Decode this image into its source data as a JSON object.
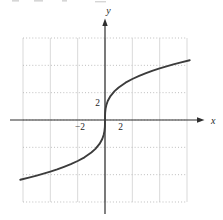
{
  "figure": {
    "background": "#ffffff",
    "axis_color": "#2e2e2e",
    "curve_color": "#3c3c3c",
    "grid_vertical_color": "#cfcfcf",
    "grid_dotted_color": "#b8b8b8",
    "label_color": "#1f1f1f"
  },
  "chart_data": {
    "type": "line",
    "title": "",
    "xlabel": "x",
    "ylabel": "y",
    "xlim": [
      -6,
      6
    ],
    "ylim": [
      -6,
      6
    ],
    "grid": "on",
    "grid_cells": 6,
    "units_per_cell": 2,
    "x_ticks": [
      {
        "value": -2,
        "label": "−2"
      },
      {
        "value": 2,
        "label": "2"
      }
    ],
    "y_ticks": [
      {
        "value": 2,
        "label": "2"
      }
    ],
    "series": [
      {
        "name": "cube-root-style odd curve through origin",
        "points": [
          [
            -6.2,
            -4.37
          ],
          [
            -5.5,
            -4.2
          ],
          [
            -5,
            -4.07
          ],
          [
            -4.5,
            -3.93
          ],
          [
            -4,
            -3.78
          ],
          [
            -3.5,
            -3.62
          ],
          [
            -3,
            -3.43
          ],
          [
            -2.5,
            -3.23
          ],
          [
            -2,
            -3.0
          ],
          [
            -1.5,
            -2.73
          ],
          [
            -1,
            -2.38
          ],
          [
            -0.7,
            -2.11
          ],
          [
            -0.4,
            -1.75
          ],
          [
            -0.2,
            -1.39
          ],
          [
            -0.1,
            -1.1
          ],
          [
            -0.04,
            -0.81
          ],
          [
            -0.01,
            -0.51
          ],
          [
            -0.002,
            -0.3
          ],
          [
            0,
            0
          ],
          [
            0.002,
            0.3
          ],
          [
            0.01,
            0.51
          ],
          [
            0.04,
            0.81
          ],
          [
            0.1,
            1.1
          ],
          [
            0.2,
            1.39
          ],
          [
            0.4,
            1.75
          ],
          [
            0.7,
            2.11
          ],
          [
            1,
            2.38
          ],
          [
            1.5,
            2.73
          ],
          [
            2,
            3.0
          ],
          [
            2.5,
            3.23
          ],
          [
            3,
            3.43
          ],
          [
            3.5,
            3.62
          ],
          [
            4,
            3.78
          ],
          [
            4.5,
            3.93
          ],
          [
            5,
            4.07
          ],
          [
            5.5,
            4.2
          ],
          [
            6.2,
            4.37
          ]
        ]
      }
    ]
  }
}
